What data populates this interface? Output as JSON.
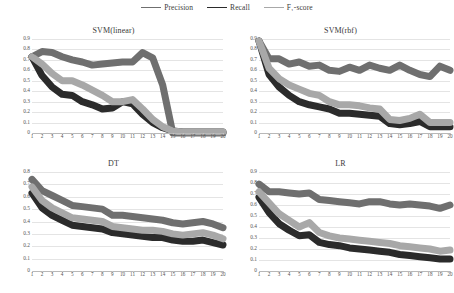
{
  "legend": {
    "position": "top-center",
    "items": [
      {
        "label": "Precision",
        "color": "#7a7a7a",
        "sub": ""
      },
      {
        "label": "Recall",
        "color": "#2e2e2e",
        "sub": ""
      },
      {
        "label": "F",
        "sub": "1",
        "label_tail": "-score",
        "color": "#a9a9a9"
      }
    ]
  },
  "series_names": [
    "Precision",
    "Recall",
    "F₁-score"
  ],
  "colors": {
    "precision": "#6f6f6f",
    "recall": "#2b2b2b",
    "f1": "#a8a8a8",
    "gridline": "#e4e4e4",
    "axis": "#b8b8b8",
    "text": "#3a3a3a"
  },
  "chart_data": [
    {
      "type": "line",
      "title": "SVM(linear)",
      "xlabel": "",
      "ylabel": "",
      "x": [
        1,
        2,
        3,
        4,
        5,
        6,
        7,
        8,
        9,
        10,
        11,
        12,
        13,
        14,
        15,
        16,
        17,
        18,
        19,
        20
      ],
      "xlim": [
        1,
        20
      ],
      "ylim": [
        0,
        0.9
      ],
      "yticks": [
        0,
        0.1,
        0.2,
        0.3,
        0.4,
        0.5,
        0.6,
        0.7,
        0.8,
        0.9
      ],
      "ytick_labels": [
        "0",
        "0.1",
        "0.2",
        "0.3",
        "0.4",
        "0.5",
        "0.6",
        "0.7",
        "0.8",
        "0.9"
      ],
      "xticks": [
        1,
        2,
        3,
        4,
        5,
        6,
        7,
        8,
        9,
        10,
        11,
        12,
        13,
        14,
        15,
        16,
        17,
        18,
        19,
        20
      ],
      "grid": true,
      "legend": "shared-top",
      "series": [
        {
          "name": "Precision",
          "color": "#6f6f6f",
          "values": [
            0.73,
            0.78,
            0.77,
            0.73,
            0.7,
            0.68,
            0.65,
            0.66,
            0.67,
            0.68,
            0.68,
            0.77,
            0.72,
            0.46,
            0.0,
            0.0,
            0.0,
            0.0,
            0.0,
            0.0
          ]
        },
        {
          "name": "Recall",
          "color": "#2b2b2b",
          "values": [
            0.73,
            0.55,
            0.44,
            0.37,
            0.36,
            0.3,
            0.27,
            0.23,
            0.24,
            0.3,
            0.28,
            0.18,
            0.1,
            0.05,
            0.02,
            0.01,
            0.01,
            0.01,
            0.01,
            0.01
          ]
        },
        {
          "name": "F₁-score",
          "color": "#a8a8a8",
          "values": [
            0.73,
            0.66,
            0.57,
            0.5,
            0.5,
            0.46,
            0.41,
            0.36,
            0.3,
            0.3,
            0.32,
            0.23,
            0.13,
            0.06,
            0.02,
            0.01,
            0.01,
            0.01,
            0.01,
            0.01
          ]
        }
      ]
    },
    {
      "type": "line",
      "title": "SVM(rbf)",
      "xlabel": "",
      "ylabel": "",
      "x": [
        1,
        2,
        3,
        4,
        5,
        6,
        7,
        8,
        9,
        10,
        11,
        12,
        13,
        14,
        15,
        16,
        17,
        18,
        19,
        20
      ],
      "xlim": [
        1,
        20
      ],
      "ylim": [
        0,
        0.9
      ],
      "yticks": [
        0,
        0.1,
        0.2,
        0.3,
        0.4,
        0.5,
        0.6,
        0.7,
        0.8,
        0.9
      ],
      "ytick_labels": [
        "0",
        "0.1",
        "0.2",
        "0.3",
        "0.4",
        "0.5",
        "0.6",
        "0.7",
        "0.8",
        "0.9"
      ],
      "xticks": [
        1,
        2,
        3,
        4,
        5,
        6,
        7,
        8,
        9,
        10,
        11,
        12,
        13,
        14,
        15,
        16,
        17,
        18,
        19,
        20
      ],
      "grid": true,
      "legend": "shared-top",
      "series": [
        {
          "name": "Precision",
          "color": "#6f6f6f",
          "values": [
            0.88,
            0.71,
            0.71,
            0.66,
            0.68,
            0.64,
            0.65,
            0.6,
            0.59,
            0.63,
            0.6,
            0.65,
            0.62,
            0.6,
            0.65,
            0.6,
            0.56,
            0.54,
            0.64,
            0.6,
            0.7
          ]
        },
        {
          "name": "Recall",
          "color": "#2b2b2b",
          "values": [
            0.88,
            0.56,
            0.44,
            0.36,
            0.3,
            0.27,
            0.25,
            0.23,
            0.19,
            0.19,
            0.18,
            0.17,
            0.16,
            0.09,
            0.08,
            0.09,
            0.11,
            0.06,
            0.06,
            0.06
          ]
        },
        {
          "name": "F₁-score",
          "color": "#a8a8a8",
          "values": [
            0.88,
            0.62,
            0.52,
            0.46,
            0.42,
            0.38,
            0.36,
            0.3,
            0.27,
            0.27,
            0.26,
            0.24,
            0.23,
            0.13,
            0.12,
            0.14,
            0.18,
            0.1,
            0.1,
            0.1
          ]
        }
      ]
    },
    {
      "type": "line",
      "title": "DT",
      "xlabel": "",
      "ylabel": "",
      "x": [
        1,
        2,
        3,
        4,
        5,
        6,
        7,
        8,
        9,
        10,
        11,
        12,
        13,
        14,
        15,
        16,
        17,
        18,
        19,
        20
      ],
      "xlim": [
        1,
        20
      ],
      "ylim": [
        0,
        0.8
      ],
      "yticks": [
        0,
        0.1,
        0.2,
        0.3,
        0.4,
        0.5,
        0.6,
        0.7,
        0.8
      ],
      "ytick_labels": [
        "0",
        "0.1",
        "0.2",
        "0.3",
        "0.4",
        "0.5",
        "0.6",
        "0.7",
        "0.8"
      ],
      "xticks": [
        1,
        2,
        3,
        4,
        5,
        6,
        7,
        8,
        9,
        10,
        11,
        12,
        13,
        14,
        15,
        16,
        17,
        18,
        19,
        20
      ],
      "grid": true,
      "legend": "shared-top",
      "series": [
        {
          "name": "Precision",
          "color": "#6f6f6f",
          "values": [
            0.74,
            0.65,
            0.61,
            0.57,
            0.53,
            0.52,
            0.51,
            0.5,
            0.45,
            0.45,
            0.44,
            0.43,
            0.42,
            0.41,
            0.39,
            0.38,
            0.39,
            0.4,
            0.38,
            0.35
          ]
        },
        {
          "name": "Recall",
          "color": "#2b2b2b",
          "values": [
            0.63,
            0.51,
            0.45,
            0.41,
            0.37,
            0.36,
            0.35,
            0.34,
            0.31,
            0.3,
            0.29,
            0.28,
            0.27,
            0.27,
            0.25,
            0.24,
            0.24,
            0.25,
            0.23,
            0.21
          ]
        },
        {
          "name": "F₁-score",
          "color": "#a8a8a8",
          "values": [
            0.68,
            0.57,
            0.51,
            0.47,
            0.43,
            0.42,
            0.41,
            0.4,
            0.36,
            0.35,
            0.34,
            0.33,
            0.33,
            0.32,
            0.3,
            0.29,
            0.3,
            0.31,
            0.29,
            0.26
          ]
        }
      ]
    },
    {
      "type": "line",
      "title": "LR",
      "xlabel": "",
      "ylabel": "",
      "x": [
        1,
        2,
        3,
        4,
        5,
        6,
        7,
        8,
        9,
        10,
        11,
        12,
        13,
        14,
        15,
        16,
        17,
        18,
        19,
        20
      ],
      "xlim": [
        1,
        20
      ],
      "ylim": [
        0,
        0.9
      ],
      "yticks": [
        0,
        0.1,
        0.2,
        0.3,
        0.4,
        0.5,
        0.6,
        0.7,
        0.8,
        0.9
      ],
      "ytick_labels": [
        "0",
        "0.1",
        "0.2",
        "0.3",
        "0.4",
        "0.5",
        "0.6",
        "0.7",
        "0.8",
        "0.9"
      ],
      "xticks": [
        1,
        2,
        3,
        4,
        5,
        6,
        7,
        8,
        9,
        10,
        11,
        12,
        13,
        14,
        15,
        16,
        17,
        18,
        19,
        20
      ],
      "grid": true,
      "legend": "shared-top",
      "series": [
        {
          "name": "Precision",
          "color": "#6f6f6f",
          "values": [
            0.79,
            0.72,
            0.72,
            0.71,
            0.7,
            0.71,
            0.65,
            0.64,
            0.63,
            0.62,
            0.61,
            0.63,
            0.63,
            0.61,
            0.6,
            0.61,
            0.6,
            0.59,
            0.57,
            0.6
          ]
        },
        {
          "name": "Recall",
          "color": "#2b2b2b",
          "values": [
            0.67,
            0.53,
            0.43,
            0.37,
            0.32,
            0.33,
            0.26,
            0.24,
            0.23,
            0.21,
            0.2,
            0.19,
            0.18,
            0.17,
            0.15,
            0.14,
            0.13,
            0.12,
            0.11,
            0.11
          ]
        },
        {
          "name": "F₁-score",
          "color": "#a8a8a8",
          "values": [
            0.72,
            0.62,
            0.52,
            0.46,
            0.4,
            0.44,
            0.35,
            0.32,
            0.3,
            0.29,
            0.28,
            0.27,
            0.26,
            0.25,
            0.23,
            0.22,
            0.21,
            0.2,
            0.18,
            0.19
          ]
        }
      ]
    }
  ]
}
